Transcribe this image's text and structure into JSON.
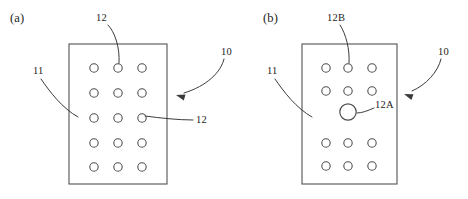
{
  "figure": {
    "type": "patent-drawing",
    "background_color": "#ffffff",
    "line_color": "#4f4f4f",
    "text_color": "#1d1d1d",
    "width": 468,
    "height": 199
  },
  "panels": [
    {
      "id": "a",
      "caption": "(a)",
      "caption_x": 10,
      "caption_y": 12,
      "plate": {
        "x": 69,
        "y": 44,
        "width": 98,
        "height": 140
      },
      "hole_rows": 5,
      "hole_cols": 3,
      "hole_radius": 4.2,
      "holes": [
        {
          "cx": 94,
          "cy": 68,
          "r": 4.2
        },
        {
          "cx": 118,
          "cy": 68,
          "r": 4.2
        },
        {
          "cx": 142,
          "cy": 68,
          "r": 4.2
        },
        {
          "cx": 94,
          "cy": 93,
          "r": 4.2
        },
        {
          "cx": 118,
          "cy": 93,
          "r": 4.2
        },
        {
          "cx": 142,
          "cy": 93,
          "r": 4.2
        },
        {
          "cx": 94,
          "cy": 118,
          "r": 4.2
        },
        {
          "cx": 118,
          "cy": 118,
          "r": 4.2
        },
        {
          "cx": 142,
          "cy": 118,
          "r": 4.2
        },
        {
          "cx": 94,
          "cy": 143,
          "r": 4.2
        },
        {
          "cx": 118,
          "cy": 143,
          "r": 4.2
        },
        {
          "cx": 142,
          "cy": 143,
          "r": 4.2
        },
        {
          "cx": 94,
          "cy": 167,
          "r": 4.2
        },
        {
          "cx": 118,
          "cy": 167,
          "r": 4.2
        },
        {
          "cx": 142,
          "cy": 167,
          "r": 4.2
        }
      ],
      "callouts": [
        {
          "name": "hole-top",
          "text": "12",
          "label_x": 96,
          "label_y": 13,
          "path": "M 108 25 C 115 32, 120 48, 119 63",
          "arrow": null
        },
        {
          "name": "plate-left",
          "text": "11",
          "label_x": 33,
          "label_y": 66,
          "path": "M 41 79 C 50 92, 62 108, 78 117",
          "arrow": null
        },
        {
          "name": "assembly-right",
          "text": "10",
          "label_x": 221,
          "label_y": 47,
          "path": "M 224 59 C 221 72, 207 86, 184 93",
          "arrow": {
            "x": 176,
            "y": 95,
            "angle": 196
          }
        },
        {
          "name": "hole-right",
          "text": "12",
          "label_x": 196,
          "label_y": 115,
          "path": "M 193 120 C 178 120, 160 118, 145 116",
          "arrow": null
        }
      ]
    },
    {
      "id": "b",
      "caption": "(b)",
      "caption_x": 263,
      "caption_y": 12,
      "plate": {
        "x": 302,
        "y": 44,
        "width": 95,
        "height": 140
      },
      "hole_radius": 4.2,
      "large_hole_radius": 8.2,
      "holes": [
        {
          "cx": 326,
          "cy": 68,
          "r": 4.2
        },
        {
          "cx": 348,
          "cy": 68,
          "r": 4.2
        },
        {
          "cx": 372,
          "cy": 68,
          "r": 4.2
        },
        {
          "cx": 326,
          "cy": 91,
          "r": 4.2
        },
        {
          "cx": 348,
          "cy": 91,
          "r": 4.2
        },
        {
          "cx": 372,
          "cy": 91,
          "r": 4.2
        },
        {
          "cx": 326,
          "cy": 143,
          "r": 4.2
        },
        {
          "cx": 348,
          "cy": 143,
          "r": 4.2
        },
        {
          "cx": 372,
          "cy": 143,
          "r": 4.2
        },
        {
          "cx": 326,
          "cy": 166,
          "r": 4.2
        },
        {
          "cx": 348,
          "cy": 166,
          "r": 4.2
        },
        {
          "cx": 372,
          "cy": 166,
          "r": 4.2
        }
      ],
      "large_holes": [
        {
          "cx": 348,
          "cy": 112,
          "r": 8.2
        }
      ],
      "callouts": [
        {
          "name": "small-hole",
          "text": "12B",
          "label_x": 327,
          "label_y": 13,
          "path": "M 340 25 C 346 34, 350 50, 349 63",
          "arrow": null
        },
        {
          "name": "plate-left",
          "text": "11",
          "label_x": 267,
          "label_y": 66,
          "path": "M 275 79 C 284 92, 296 108, 312 117",
          "arrow": null
        },
        {
          "name": "assembly-right",
          "text": "10",
          "label_x": 438,
          "label_y": 47,
          "path": "M 441 59 C 438 72, 426 85, 412 91",
          "arrow": {
            "x": 404,
            "y": 94,
            "angle": 200
          }
        },
        {
          "name": "large-hole",
          "text": "12A",
          "label_x": 375,
          "label_y": 100,
          "path": "M 374 108 C 367 111, 362 113, 357 113",
          "arrow": null
        }
      ]
    }
  ]
}
